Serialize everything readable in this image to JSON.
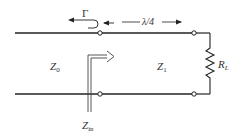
{
  "diagram": {
    "labels": {
      "reflection": "Γ",
      "length": "λ/4",
      "z0_main": "Z",
      "z0_sub": "0",
      "z1_main": "Z",
      "z1_sub": "1",
      "rl_main": "R",
      "rl_sub": "L",
      "zin_main": "Z",
      "zin_sub": "in"
    },
    "colors": {
      "line": "#222222",
      "text": "#333333",
      "background": "#ffffff"
    }
  }
}
